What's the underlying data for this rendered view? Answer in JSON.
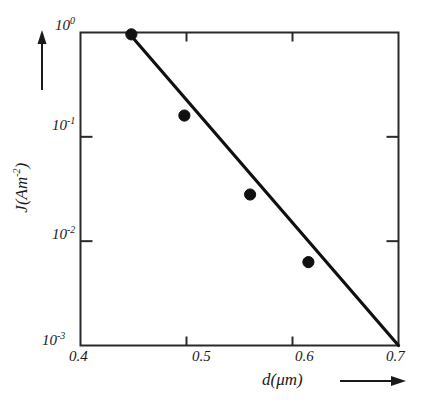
{
  "chart_data": {
    "type": "line",
    "title": "",
    "subtitle": "",
    "xlabel": "d(μm)",
    "ylabel": "J(Am⁻²)",
    "xlabel_base": "d(",
    "xlabel_unit": "μm",
    "xlabel_close": ")",
    "ylabel_base": "J(Am",
    "ylabel_exp": "-2",
    "ylabel_close": ")",
    "x_scale": "linear",
    "y_scale": "log",
    "xlim": [
      0.4,
      0.7
    ],
    "ylim": [
      0.001,
      1.0
    ],
    "grid": false,
    "legend": null,
    "x_ticks": [
      {
        "value": 0.4,
        "label": "0.4"
      },
      {
        "value": 0.5,
        "label": "0.5"
      },
      {
        "value": 0.6,
        "label": "0.6"
      },
      {
        "value": 0.7,
        "label": "0.7"
      }
    ],
    "y_ticks": [
      {
        "value": 1.0,
        "mantissa": "10",
        "exponent": "0",
        "label": "10⁰"
      },
      {
        "value": 0.1,
        "mantissa": "10",
        "exponent": "-1",
        "label": "10⁻¹"
      },
      {
        "value": 0.01,
        "mantissa": "10",
        "exponent": "-2",
        "label": "10⁻²"
      },
      {
        "value": 0.001,
        "mantissa": "10",
        "exponent": "-3",
        "label": "10⁻³"
      }
    ],
    "series": [
      {
        "name": "J vs d",
        "marker": "filled-circle",
        "marker_color": "#101010",
        "line_color": "#101010",
        "x": [
          0.448,
          0.498,
          0.56,
          0.615
        ],
        "y": [
          0.96,
          0.16,
          0.028,
          0.0063
        ]
      }
    ],
    "fit_line": {
      "name": "log-linear fit",
      "x_start": 0.4366,
      "y_start": 1.26,
      "x_end": 0.7,
      "y_end": 0.001,
      "color": "#101010"
    },
    "annotations": [
      {
        "name": "y-axis-arrow",
        "symbol": "↑",
        "meaning": "increasing J"
      },
      {
        "name": "x-axis-arrow",
        "symbol": "→",
        "meaning": "increasing d"
      }
    ]
  },
  "axis_arrows": {
    "y_arrow": "↑",
    "x_arrow": "→"
  }
}
